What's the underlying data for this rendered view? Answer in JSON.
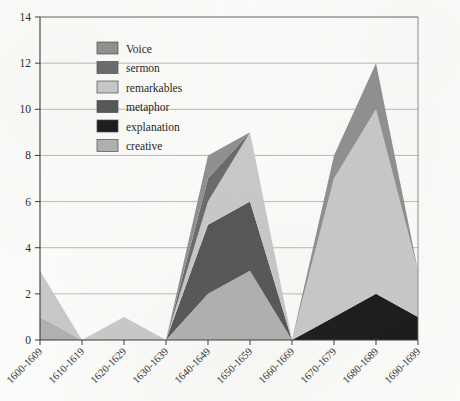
{
  "chart_data": {
    "type": "area",
    "stacked": true,
    "title": "",
    "subtitle": "",
    "xlabel": "",
    "ylabel": "",
    "ylim": [
      0,
      14
    ],
    "ytick_step": 2,
    "yticks": [
      "0",
      "2",
      "4",
      "6",
      "8",
      "10",
      "12",
      "14"
    ],
    "grid": "horizontal",
    "legend_position": "upper-left-inside",
    "categories": [
      "1600-1609",
      "1610-1619",
      "1620-1629",
      "1630-1639",
      "1640-1649",
      "1650-1659",
      "1660-1669",
      "1670-1679",
      "1680-1689",
      "1690-1699"
    ],
    "stack_order_bottom_to_top": [
      "creative",
      "explanation",
      "metaphor",
      "remarkables",
      "sermon",
      "Voice"
    ],
    "series": [
      {
        "name": "Voice",
        "color": "#8f8f8f",
        "values": [
          0,
          0,
          0,
          0,
          1,
          0,
          0,
          1,
          2,
          0
        ]
      },
      {
        "name": "sermon",
        "color": "#6a6a6a",
        "values": [
          0,
          0,
          0,
          0,
          1,
          0,
          0,
          0,
          0,
          0
        ]
      },
      {
        "name": "remarkables",
        "color": "#c8c8c8",
        "values": [
          2,
          0,
          1,
          0,
          1,
          3,
          0,
          6,
          8,
          2
        ]
      },
      {
        "name": "metaphor",
        "color": "#555555",
        "values": [
          0,
          0,
          0,
          0,
          3,
          3,
          0,
          0,
          0,
          0
        ]
      },
      {
        "name": "explanation",
        "color": "#1a1a1a",
        "values": [
          0,
          0,
          0,
          0,
          0,
          0,
          0,
          1,
          2,
          1
        ]
      },
      {
        "name": "creative",
        "color": "#b0b0b0",
        "values": [
          1,
          0,
          0,
          0,
          2,
          3,
          0,
          0,
          0,
          0
        ]
      }
    ],
    "totals": [
      3,
      0,
      1,
      0,
      8,
      9,
      0,
      8,
      12,
      3
    ]
  },
  "legend": {
    "items": [
      {
        "label": "Voice",
        "color": "#8f8f8f"
      },
      {
        "label": "sermon",
        "color": "#6a6a6a"
      },
      {
        "label": "remarkables",
        "color": "#c8c8c8"
      },
      {
        "label": "metaphor",
        "color": "#555555"
      },
      {
        "label": "explanation",
        "color": "#1a1a1a"
      },
      {
        "label": "creative",
        "color": "#b0b0b0"
      }
    ]
  },
  "axes": {
    "y_labels": [
      "14",
      "12",
      "10",
      "8",
      "6",
      "4",
      "2",
      "0"
    ],
    "x_labels": [
      "1600-1609",
      "1610-1619",
      "1620-1629",
      "1630-1639",
      "1640-1649",
      "1650-1659",
      "1660-1669",
      "1670-1679",
      "1680-1689",
      "1690-1699"
    ]
  }
}
